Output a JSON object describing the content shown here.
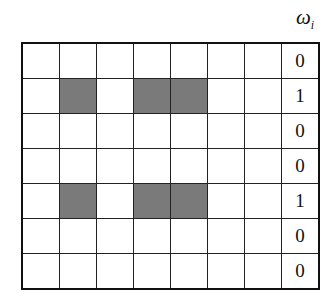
{
  "header": {
    "symbol": "ω",
    "subscript": "i"
  },
  "grid": {
    "rows": 7,
    "cols": 7,
    "shaded_color": "#7a7a7a",
    "cells": [
      [
        0,
        0,
        0,
        0,
        0,
        0,
        0
      ],
      [
        0,
        1,
        0,
        1,
        1,
        0,
        0
      ],
      [
        0,
        0,
        0,
        0,
        0,
        0,
        0
      ],
      [
        0,
        0,
        0,
        0,
        0,
        0,
        0
      ],
      [
        0,
        1,
        0,
        1,
        1,
        0,
        0
      ],
      [
        0,
        0,
        0,
        0,
        0,
        0,
        0
      ],
      [
        0,
        0,
        0,
        0,
        0,
        0,
        0
      ]
    ],
    "weights": [
      "0",
      "1",
      "0",
      "0",
      "1",
      "0",
      "0"
    ]
  }
}
